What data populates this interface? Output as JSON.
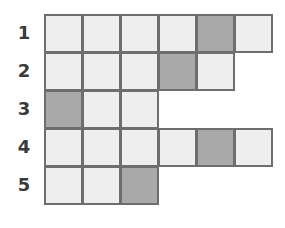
{
  "figure": {
    "type": "grid-diagram",
    "title": "",
    "colors": {
      "light_cell": "#eeeeee",
      "dark_cell": "#a9a9a9",
      "cell_border": "#6e6e6e",
      "label_text": "#3a3a3a",
      "background": "#ffffff"
    },
    "geometry": {
      "origin_x": 44,
      "origin_y": 14,
      "cell_width": 38,
      "cell_height": 38,
      "label_column_x": 9
    },
    "rows": [
      {
        "label": "1",
        "cell_count": 6,
        "shaded_columns": [
          5
        ],
        "cells": [
          "light",
          "light",
          "light",
          "light",
          "dark",
          "light"
        ]
      },
      {
        "label": "2",
        "cell_count": 5,
        "shaded_columns": [
          4
        ],
        "cells": [
          "light",
          "light",
          "light",
          "dark",
          "light"
        ]
      },
      {
        "label": "3",
        "cell_count": 3,
        "shaded_columns": [
          1
        ],
        "cells": [
          "dark",
          "light",
          "light"
        ]
      },
      {
        "label": "4",
        "cell_count": 6,
        "shaded_columns": [
          5
        ],
        "cells": [
          "light",
          "light",
          "light",
          "light",
          "dark",
          "light"
        ]
      },
      {
        "label": "5",
        "cell_count": 3,
        "shaded_columns": [
          3
        ],
        "cells": [
          "light",
          "light",
          "dark"
        ]
      }
    ]
  }
}
